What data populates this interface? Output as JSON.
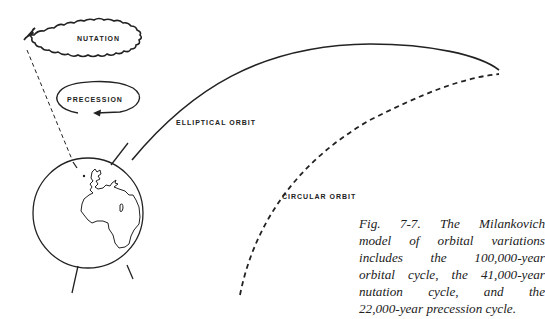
{
  "figure": {
    "labels": {
      "nutation": "NUTATION",
      "precession": "PRECESSION",
      "elliptical_orbit": "ELLIPTICAL ORBIT",
      "circular_orbit": "CIRCULAR ORBIT"
    },
    "caption_lines": [
      "Fig. 7-7. The Milankovich",
      "model of orbital variations",
      "includes the 100,000-year",
      "orbital cycle, the 41,000-year",
      "nutation cycle, and the",
      "22,000-year precession cycle."
    ],
    "elements": [
      "earth-globe",
      "axis-line",
      "nutation-wobble-ellipse",
      "precession-ellipse-arrow",
      "elliptical-orbit-curve",
      "circular-orbit-dashed-curve"
    ],
    "colors": {
      "ink": "#222222",
      "background": "#ffffff"
    }
  }
}
